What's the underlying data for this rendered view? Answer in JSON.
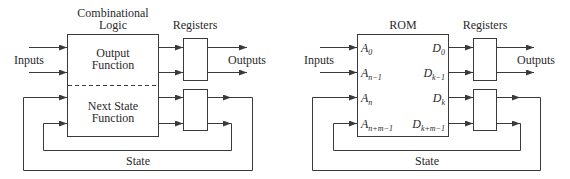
{
  "left_diagram": {
    "block_title_line1": "Combinational",
    "block_title_line2": "Logic",
    "output_function_line1": "Output",
    "output_function_line2": "Function",
    "next_state_line1": "Next State",
    "next_state_line2": "Function",
    "registers_label": "Registers",
    "inputs_label": "Inputs",
    "outputs_label": "Outputs",
    "state_label": "State"
  },
  "right_diagram": {
    "block_title": "ROM",
    "registers_label": "Registers",
    "inputs_label": "Inputs",
    "outputs_label": "Outputs",
    "state_label": "State",
    "address_ports": [
      {
        "base": "A",
        "sub": "0"
      },
      {
        "base": "A",
        "sub": "n−1"
      },
      {
        "base": "A",
        "sub": "n"
      },
      {
        "base": "A",
        "sub": "n+m−1"
      }
    ],
    "data_ports": [
      {
        "base": "D",
        "sub": "0"
      },
      {
        "base": "D",
        "sub": "k−1"
      },
      {
        "base": "D",
        "sub": "k"
      },
      {
        "base": "D",
        "sub": "k+m−1"
      }
    ]
  },
  "colors": {
    "line": "#3a3a3a",
    "text": "#2a2a2a",
    "background": "#ffffff"
  }
}
